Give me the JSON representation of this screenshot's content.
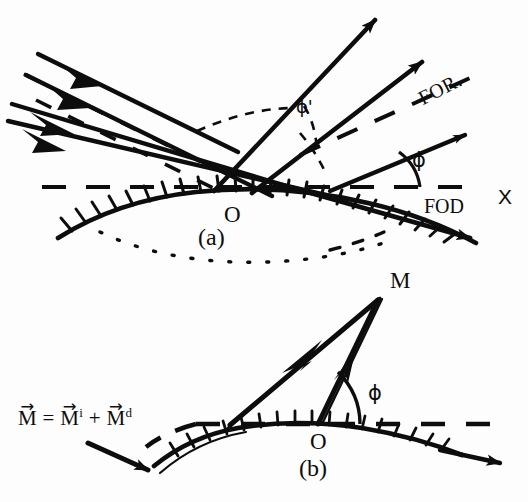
{
  "figure": {
    "background_color": "#fdfdfd",
    "ink_color": "#0d0d0d",
    "width": 528,
    "height": 502
  },
  "panel_a": {
    "caption": "(a)",
    "labels": {
      "origin": "O",
      "axis_x": "X",
      "specular_label": "FOR.",
      "diffuse_label": "FOD",
      "angle_phi": "ϕ",
      "angle_phi_prime": "ϕ'"
    },
    "elements": {
      "incident_rays_count": 4,
      "reflected_rays_count": 2,
      "surface_type": "hatched-curve",
      "dotted_arc": true,
      "dashed_axis": true
    }
  },
  "panel_b": {
    "caption": "(b)",
    "labels": {
      "origin": "O",
      "vector_tip": "M",
      "angle_phi": "ϕ"
    },
    "formula": {
      "lhs": "M",
      "eq": "=",
      "term1": "M",
      "term1_sup": "i",
      "plus": "+",
      "term2": "M",
      "term2_sup": "d",
      "plain_text": "M⃗ = M⃗ⁱ + M⃗ᵈ"
    },
    "elements": {
      "vectors_count": 2,
      "surface_type": "hatched-curve",
      "dashed_axis": true,
      "pointer_arrow": true
    }
  }
}
